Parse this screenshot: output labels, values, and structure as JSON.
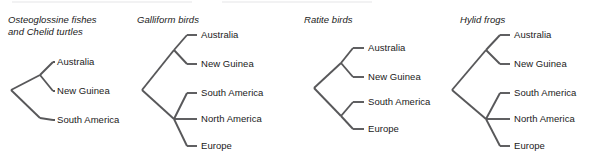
{
  "figure": {
    "background_color": "#ffffff",
    "line_color": "#58585a",
    "text_color": "#1a1a1a",
    "width": 605,
    "height": 160
  },
  "panels": [
    {
      "id": "osteoglossine-fishes-and-chelid-turtles",
      "title": "Osteoglossine fishes\nand Chelid turtles",
      "title_x": 8,
      "title_y": 14,
      "leaf_label_x": 57,
      "leaves": [
        {
          "label": "Australia",
          "y": 62
        },
        {
          "label": "New Guinea",
          "y": 91
        },
        {
          "label": "South America",
          "y": 120
        }
      ],
      "topology": "((Australia,New Guinea),South America)",
      "nodes": {
        "root": {
          "x": 11,
          "y": 90
        },
        "inner": {
          "x": 40,
          "y": 75
        }
      },
      "tip_x": 53
    },
    {
      "id": "galliform-birds",
      "title": "Galliform birds",
      "title_x": 137,
      "title_y": 14,
      "leaf_label_x": 190,
      "leaves": [
        {
          "label": "Australia",
          "y": 35
        },
        {
          "label": "New Guinea",
          "y": 64
        },
        {
          "label": "South America",
          "y": 93
        },
        {
          "label": "North America",
          "y": 119
        },
        {
          "label": "Europe",
          "y": 146
        }
      ],
      "topology": "((Australia,New Guinea),(South America,North America,Europe))",
      "nodes": {
        "root": {
          "x": 142,
          "y": 90
        },
        "clade_upper": {
          "x": 174,
          "y": 50
        },
        "clade_lower": {
          "x": 174,
          "y": 119
        }
      },
      "tip_x": 187
    },
    {
      "id": "ratite-birds",
      "title": "Ratite birds",
      "title_x": 303,
      "title_y": 14,
      "leaf_label_x": 356,
      "leaves": [
        {
          "label": "Australia",
          "y": 48
        },
        {
          "label": "New Guinea",
          "y": 77
        },
        {
          "label": "South America",
          "y": 102
        },
        {
          "label": "Europe",
          "y": 129
        }
      ],
      "topology": "((Australia,New Guinea),(South America,Europe))",
      "nodes": {
        "root": {
          "x": 314,
          "y": 88
        },
        "clade_upper": {
          "x": 341,
          "y": 63
        },
        "clade_lower": {
          "x": 341,
          "y": 116
        }
      },
      "tip_x": 353
    },
    {
      "id": "hylid-frogs",
      "title": "Hylid frogs",
      "title_x": 460,
      "title_y": 14,
      "leaf_label_x": 528,
      "leaves": [
        {
          "label": "Australia",
          "y": 35
        },
        {
          "label": "New Guinea",
          "y": 64
        },
        {
          "label": "South America",
          "y": 93
        },
        {
          "label": "North America",
          "y": 119
        },
        {
          "label": "Europe",
          "y": 146
        }
      ],
      "topology": "((Australia,New Guinea),(South America,North America,Europe))",
      "nodes": {
        "root": {
          "x": 452,
          "y": 90
        },
        "clade_upper": {
          "x": 486,
          "y": 50
        },
        "clade_lower": {
          "x": 486,
          "y": 119
        }
      },
      "tip_x": 508
    }
  ]
}
